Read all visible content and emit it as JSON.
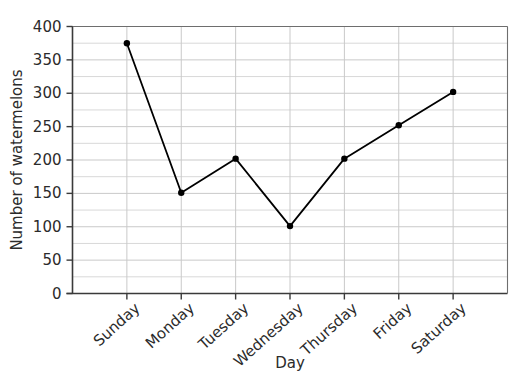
{
  "chart_data": {
    "type": "line",
    "title": "",
    "xlabel": "Day",
    "ylabel": "Number of watermelons",
    "categories": [
      "Sunday",
      "Monday",
      "Tuesday",
      "Wednesday",
      "Thursday",
      "Friday",
      "Saturday"
    ],
    "values": [
      375,
      151,
      202,
      101,
      202,
      252,
      302
    ],
    "series": [
      {
        "name": "Number of watermelons",
        "values": [
          375,
          151,
          202,
          101,
          202,
          252,
          302
        ]
      }
    ],
    "ylim": [
      0,
      400
    ],
    "y_major_ticks": [
      0,
      50,
      100,
      150,
      200,
      250,
      300,
      350,
      400
    ],
    "y_tick_labels": [
      "0",
      "50",
      "100",
      "150",
      "200",
      "250",
      "300",
      "350",
      "400"
    ],
    "y_minor_step": 25,
    "grid": true,
    "grid_axis": "both",
    "legend": false,
    "legend_position": "none",
    "marker": "circle",
    "xtick_label_rotation": -42,
    "colors": {
      "line": "#000000",
      "marker": "#000000",
      "grid": "#c9c9c9",
      "axis": "#3a3a3a",
      "text": "#2b2b2b",
      "background": "#ffffff"
    },
    "points": [
      {
        "day": "Sunday",
        "value": 375
      },
      {
        "day": "Monday",
        "value": 151
      },
      {
        "day": "Tuesday",
        "value": 202
      },
      {
        "day": "Wednesday",
        "value": 101
      },
      {
        "day": "Thursday",
        "value": 202
      },
      {
        "day": "Friday",
        "value": 252
      },
      {
        "day": "Saturday",
        "value": 302
      }
    ]
  }
}
